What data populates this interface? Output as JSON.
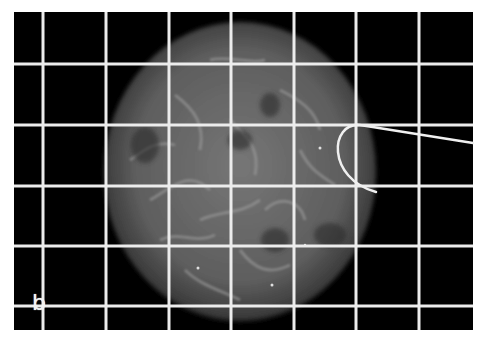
{
  "figure": {
    "panel_label": "b",
    "colors": {
      "background": "#000000",
      "grid": "#ececec",
      "page": "#ffffff",
      "nucleus": "#6a6a6a",
      "filaments": "#a8a8a8"
    },
    "image_bounds": {
      "x": 14,
      "y": 12,
      "width": 459,
      "height": 318
    },
    "grid": {
      "vertical_lines_x": [
        43,
        106,
        169,
        231,
        294,
        356,
        419
      ],
      "horizontal_lines_y": [
        64,
        125,
        186,
        246,
        306
      ]
    },
    "nucleus": {
      "cx": 240,
      "cy": 172,
      "rx": 136,
      "ry": 150
    },
    "pipette_path": "M473,143 L360,125 C330,122 326,178 376,192"
  }
}
